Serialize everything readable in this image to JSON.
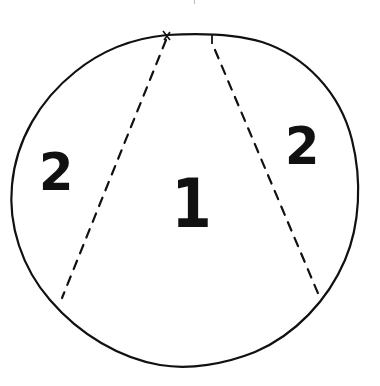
{
  "diagram": {
    "stroke_color": "#111111",
    "background_color": "#ffffff",
    "circle": {
      "shape": "hand-drawn circle",
      "center": [
        190,
        205
      ],
      "radius_x": 170,
      "radius_y": 168
    },
    "dividers": [
      {
        "name": "left-divider",
        "style": "dashed",
        "from": [
          167,
          36
        ],
        "to": [
          62,
          298
        ]
      },
      {
        "name": "right-divider",
        "style": "dashed",
        "from": [
          212,
          36
        ],
        "to": [
          320,
          298
        ]
      }
    ],
    "regions": [
      {
        "name": "left-region",
        "label": "2"
      },
      {
        "name": "center-region",
        "label": "1"
      },
      {
        "name": "right-region",
        "label": "2"
      }
    ]
  }
}
